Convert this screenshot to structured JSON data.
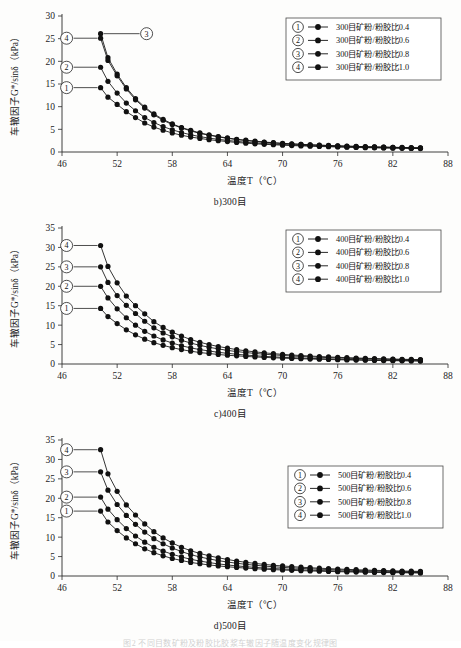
{
  "page": {
    "bottom_caption": "图2 不同目数矿粉及粉胶比胶浆车辙因子随温度变化规律图"
  },
  "axis": {
    "x_label": "温度T（℃）",
    "y_label": "车辙因子G*/sinδ（kPa）",
    "x_ticks": [
      46,
      52,
      58,
      64,
      70,
      76,
      82,
      88
    ],
    "x_min": 46,
    "x_max": 88
  },
  "chart_data": [
    {
      "type": "line",
      "id": "chart-300mesh",
      "title": "b)300目",
      "xlabel": "温度T（℃）",
      "ylabel": "车辙因子G*/sinδ（kPa）",
      "xlim": [
        46,
        88
      ],
      "ylim": [
        0,
        30
      ],
      "y_ticks": [
        0,
        5,
        10,
        15,
        20,
        25,
        30
      ],
      "x_ticks": [
        46,
        52,
        58,
        64,
        70,
        76,
        82,
        88
      ],
      "grid": false,
      "legend_position": "top-right",
      "x": [
        50.2,
        51.0,
        52.0,
        53.0,
        54.0,
        55.0,
        56.0,
        57.0,
        58.0,
        59.0,
        60.0,
        61.0,
        62.0,
        63.0,
        64.0,
        65.0,
        66.0,
        67.0,
        68.0,
        69.0,
        70.0,
        71.0,
        72.0,
        73.0,
        74.0,
        75.0,
        76.0,
        77.0,
        78.0,
        79.0,
        80.0,
        81.0,
        82.0,
        83.0,
        84.0,
        85.0
      ],
      "series": [
        {
          "name": "300目矿粉/粉胶比0.4",
          "marker": "①",
          "values": [
            14.2,
            12.1,
            10.5,
            8.9,
            7.6,
            6.4,
            5.5,
            4.8,
            4.2,
            3.7,
            3.3,
            3.0,
            2.7,
            2.5,
            2.3,
            2.1,
            1.95,
            1.8,
            1.7,
            1.6,
            1.5,
            1.42,
            1.35,
            1.28,
            1.22,
            1.16,
            1.1,
            1.05,
            1.0,
            0.96,
            0.92,
            0.88,
            0.85,
            0.82,
            0.79,
            0.76
          ]
        },
        {
          "name": "300目矿粉/粉胶比0.6",
          "marker": "②",
          "values": [
            18.7,
            15.6,
            13.0,
            10.8,
            9.1,
            7.6,
            6.5,
            5.6,
            4.9,
            4.3,
            3.8,
            3.4,
            3.05,
            2.8,
            2.55,
            2.35,
            2.15,
            2.0,
            1.87,
            1.75,
            1.65,
            1.55,
            1.47,
            1.39,
            1.32,
            1.25,
            1.19,
            1.13,
            1.08,
            1.03,
            0.99,
            0.95,
            0.91,
            0.87,
            0.84,
            0.81
          ]
        },
        {
          "name": "300目矿粉/粉胶比0.8",
          "marker": "③",
          "values": [
            26.1,
            20.8,
            17.2,
            14.2,
            11.8,
            9.9,
            8.4,
            7.2,
            6.2,
            5.4,
            4.8,
            4.2,
            3.8,
            3.4,
            3.1,
            2.8,
            2.6,
            2.4,
            2.2,
            2.05,
            1.92,
            1.8,
            1.7,
            1.6,
            1.52,
            1.44,
            1.37,
            1.3,
            1.24,
            1.18,
            1.13,
            1.08,
            1.04,
            1.0,
            0.96,
            0.92
          ]
        },
        {
          "name": "300目矿粉/粉胶比1.0",
          "marker": "④",
          "values": [
            25.1,
            20.2,
            16.8,
            13.9,
            11.5,
            9.7,
            8.2,
            7.0,
            6.05,
            5.3,
            4.65,
            4.1,
            3.7,
            3.35,
            3.0,
            2.75,
            2.52,
            2.32,
            2.15,
            2.0,
            1.87,
            1.76,
            1.66,
            1.57,
            1.49,
            1.41,
            1.34,
            1.27,
            1.21,
            1.16,
            1.11,
            1.06,
            1.02,
            0.98,
            0.94,
            0.9
          ]
        }
      ],
      "callouts": [
        {
          "marker": "③",
          "side": "right",
          "series_index": 2
        },
        {
          "marker": "④",
          "side": "left",
          "series_index": 3
        },
        {
          "marker": "②",
          "side": "left",
          "series_index": 1
        },
        {
          "marker": "①",
          "side": "left",
          "series_index": 0
        }
      ]
    },
    {
      "type": "line",
      "id": "chart-400mesh",
      "title": "c)400目",
      "xlabel": "温度T（℃）",
      "ylabel": "车辙因子G*/sinδ（kPa）",
      "xlim": [
        46,
        88
      ],
      "ylim": [
        0,
        35
      ],
      "y_ticks": [
        0,
        5,
        10,
        15,
        20,
        25,
        30,
        35
      ],
      "x_ticks": [
        46,
        52,
        58,
        64,
        70,
        76,
        82,
        88
      ],
      "grid": false,
      "legend_position": "top-right",
      "x": [
        50.2,
        51.0,
        52.0,
        53.0,
        54.0,
        55.0,
        56.0,
        57.0,
        58.0,
        59.0,
        60.0,
        61.0,
        62.0,
        63.0,
        64.0,
        65.0,
        66.0,
        67.0,
        68.0,
        69.0,
        70.0,
        71.0,
        72.0,
        73.0,
        74.0,
        75.0,
        76.0,
        77.0,
        78.0,
        79.0,
        80.0,
        81.0,
        82.0,
        83.0,
        84.0,
        85.0
      ],
      "series": [
        {
          "name": "400目矿粉/粉胶比0.4",
          "marker": "①",
          "values": [
            14.3,
            12.2,
            10.4,
            8.8,
            7.5,
            6.4,
            5.5,
            4.8,
            4.2,
            3.7,
            3.3,
            2.95,
            2.7,
            2.45,
            2.25,
            2.1,
            1.95,
            1.82,
            1.7,
            1.6,
            1.5,
            1.42,
            1.35,
            1.28,
            1.22,
            1.16,
            1.1,
            1.05,
            1.0,
            0.96,
            0.92,
            0.88,
            0.85,
            0.82,
            0.79,
            0.76
          ]
        },
        {
          "name": "400目矿粉/粉胶比0.6",
          "marker": "②",
          "values": [
            20.0,
            17.0,
            14.2,
            11.9,
            10.0,
            8.4,
            7.2,
            6.2,
            5.4,
            4.7,
            4.15,
            3.7,
            3.35,
            3.0,
            2.75,
            2.5,
            2.3,
            2.12,
            1.97,
            1.84,
            1.72,
            1.62,
            1.53,
            1.45,
            1.37,
            1.3,
            1.24,
            1.18,
            1.12,
            1.07,
            1.02,
            0.98,
            0.94,
            0.9,
            0.87,
            0.84
          ]
        },
        {
          "name": "400目矿粉/粉胶比0.8",
          "marker": "③",
          "values": [
            25.0,
            21.0,
            17.6,
            15.1,
            13.0,
            11.0,
            9.3,
            8.0,
            7.0,
            6.1,
            5.4,
            4.8,
            4.3,
            3.9,
            3.5,
            3.2,
            2.95,
            2.72,
            2.52,
            2.35,
            2.2,
            2.06,
            1.94,
            1.83,
            1.73,
            1.64,
            1.56,
            1.48,
            1.41,
            1.34,
            1.28,
            1.22,
            1.17,
            1.12,
            1.08,
            1.04
          ]
        },
        {
          "name": "400目矿粉/粉胶比1.0",
          "marker": "④",
          "values": [
            30.5,
            25.1,
            20.9,
            17.5,
            15.0,
            12.9,
            10.9,
            9.4,
            8.2,
            7.2,
            6.3,
            5.6,
            5.0,
            4.5,
            4.1,
            3.7,
            3.4,
            3.12,
            2.88,
            2.67,
            2.48,
            2.32,
            2.18,
            2.05,
            1.93,
            1.82,
            1.72,
            1.63,
            1.55,
            1.47,
            1.4,
            1.34,
            1.28,
            1.22,
            1.17,
            1.12
          ]
        }
      ],
      "callouts": [
        {
          "marker": "④",
          "side": "left",
          "series_index": 3
        },
        {
          "marker": "③",
          "side": "left",
          "series_index": 2
        },
        {
          "marker": "②",
          "side": "left",
          "series_index": 1
        },
        {
          "marker": "①",
          "side": "left",
          "series_index": 0
        }
      ]
    },
    {
      "type": "line",
      "id": "chart-500mesh",
      "title": "d)500目",
      "xlabel": "温度T（℃）",
      "ylabel": "车辙因子G*/sinδ（kPa）",
      "xlim": [
        46,
        88
      ],
      "ylim": [
        0,
        35
      ],
      "y_ticks": [
        0,
        5,
        10,
        15,
        20,
        25,
        30,
        35
      ],
      "x_ticks": [
        46,
        52,
        58,
        64,
        70,
        76,
        82,
        88
      ],
      "grid": false,
      "legend_position": "right",
      "x": [
        50.2,
        51.0,
        52.0,
        53.0,
        54.0,
        55.0,
        56.0,
        57.0,
        58.0,
        59.0,
        60.0,
        61.0,
        62.0,
        63.0,
        64.0,
        65.0,
        66.0,
        67.0,
        68.0,
        69.0,
        70.0,
        71.0,
        72.0,
        73.0,
        74.0,
        75.0,
        76.0,
        77.0,
        78.0,
        79.0,
        80.0,
        81.0,
        82.0,
        83.0,
        84.0,
        85.0
      ],
      "series": [
        {
          "name": "500目矿粉/粉胶比0.4",
          "marker": "①",
          "values": [
            16.7,
            13.9,
            11.7,
            9.8,
            8.3,
            7.0,
            6.0,
            5.2,
            4.5,
            4.0,
            3.5,
            3.15,
            2.85,
            2.6,
            2.38,
            2.2,
            2.03,
            1.88,
            1.75,
            1.64,
            1.54,
            1.45,
            1.37,
            1.3,
            1.23,
            1.17,
            1.11,
            1.06,
            1.01,
            0.97,
            0.93,
            0.89,
            0.86,
            0.83,
            0.8,
            0.77
          ]
        },
        {
          "name": "500目矿粉/粉胶比0.6",
          "marker": "②",
          "values": [
            20.3,
            17.2,
            14.5,
            12.2,
            10.3,
            8.7,
            7.4,
            6.4,
            5.6,
            4.9,
            4.3,
            3.85,
            3.45,
            3.12,
            2.85,
            2.6,
            2.4,
            2.22,
            2.06,
            1.92,
            1.8,
            1.69,
            1.59,
            1.5,
            1.42,
            1.35,
            1.28,
            1.22,
            1.16,
            1.11,
            1.06,
            1.01,
            0.97,
            0.93,
            0.9,
            0.87
          ]
        },
        {
          "name": "500目矿粉/粉胶比0.8",
          "marker": "③",
          "values": [
            26.8,
            22.1,
            18.4,
            15.6,
            13.3,
            11.3,
            9.6,
            8.3,
            7.2,
            6.3,
            5.5,
            4.9,
            4.4,
            3.95,
            3.6,
            3.28,
            3.0,
            2.77,
            2.56,
            2.38,
            2.22,
            2.08,
            1.96,
            1.85,
            1.75,
            1.66,
            1.57,
            1.49,
            1.42,
            1.35,
            1.29,
            1.23,
            1.18,
            1.13,
            1.09,
            1.05
          ]
        },
        {
          "name": "500目矿粉/粉胶比1.0",
          "marker": "④",
          "values": [
            32.5,
            26.3,
            21.8,
            18.3,
            15.7,
            13.4,
            11.4,
            9.8,
            8.5,
            7.4,
            6.5,
            5.8,
            5.2,
            4.7,
            4.25,
            3.85,
            3.52,
            3.24,
            2.99,
            2.77,
            2.58,
            2.41,
            2.26,
            2.13,
            2.01,
            1.9,
            1.8,
            1.71,
            1.62,
            1.54,
            1.47,
            1.4,
            1.34,
            1.28,
            1.23,
            1.18
          ]
        }
      ],
      "callouts": [
        {
          "marker": "④",
          "side": "left",
          "series_index": 3
        },
        {
          "marker": "③",
          "side": "left",
          "series_index": 2
        },
        {
          "marker": "②",
          "side": "left",
          "series_index": 1
        },
        {
          "marker": "①",
          "side": "left",
          "series_index": 0
        }
      ]
    }
  ]
}
